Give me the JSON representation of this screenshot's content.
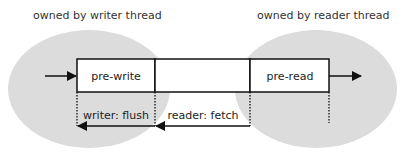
{
  "diagram": {
    "regions": [
      {
        "id": "writer",
        "label": "owned by writer thread",
        "fill": "#dcdcdc"
      },
      {
        "id": "reader",
        "label": "owned by reader thread",
        "fill": "#dcdcdc"
      }
    ],
    "buffer": {
      "cells": [
        {
          "id": "pre-write",
          "label": "pre-write"
        },
        {
          "id": "middle",
          "label": ""
        },
        {
          "id": "pre-read",
          "label": "pre-read"
        }
      ]
    },
    "operations": [
      {
        "id": "writer-flush",
        "label": "writer: flush"
      },
      {
        "id": "reader-fetch",
        "label": "reader: fetch"
      }
    ],
    "colors": {
      "region_fill": "#dcdcdc",
      "stroke": "#111111",
      "cell_fill": "#ffffff",
      "text": "#333333"
    }
  }
}
